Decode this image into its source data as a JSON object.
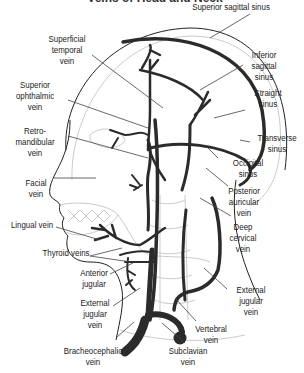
{
  "title": "Veins of Head and Neck",
  "colors": {
    "vein": "#2b2b2b",
    "outline": "#222222",
    "faint": "#bdbdbd",
    "leader": "#444444",
    "text": "#222222"
  },
  "labels": {
    "superior_sagittal_sinus": "Superior sagittal sinus",
    "superficial_temporal_vein": "Superficial\ntemporal\nvein",
    "inferior_sagittal_sinus": "Inferior\nsagittal\nsinus",
    "superior_ophthalmic_vein": "Superior\nophthalmic\nvein",
    "straight_sinus": "Straight\nsinus",
    "retromandibular_vein": "Retro-\nmandibular\nvein",
    "transverse_sinus": "Transverse\nsinus",
    "occipital_sinus": "Occipital\nsinus",
    "facial_vein": "Facial\nvein",
    "posterior_auricular_vein": "Posterior\nauricular\nvein",
    "lingual_vein": "Lingual vein",
    "deep_cervical_vein": "Deep\ncervical\nvein",
    "thyroid_veins": "Thyroid veins",
    "anterior_jugular": "Anterior\njugular",
    "external_jugular_vein_left": "External\njugular\nvein",
    "external_jugular_vein_right": "External\njugular\nvein",
    "vertebral_vein": "Vertebral\nvein",
    "bracheocephalic_vein": "Bracheocephalic\nvein",
    "subclavian_vein": "Subclavian\nvein"
  }
}
